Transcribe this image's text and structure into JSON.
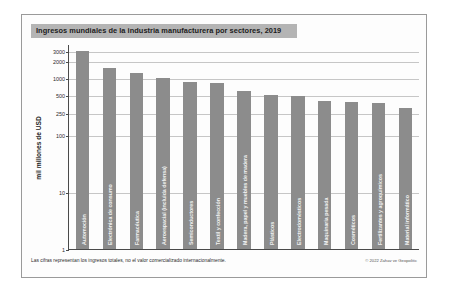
{
  "chart_data": {
    "type": "bar",
    "title": "Ingresos mundiales de la industria manufacturera por sectores, 2019",
    "xlabel": "",
    "ylabel": "mil millones de USD",
    "yscale": "log",
    "ylim": [
      1,
      4000
    ],
    "ytick_labels": [
      "3000",
      "2000",
      "1000",
      "500",
      "250",
      "100",
      "10",
      "1"
    ],
    "ytick_values": [
      3000,
      2000,
      1000,
      500,
      250,
      100,
      10,
      1
    ],
    "grid": true,
    "legend": "none",
    "categories": [
      "Automoción",
      "Electrónica de consumo",
      "Farmacéutica",
      "Aeroespacial (incluida defensa)",
      "Semiconductores",
      "Textil y confección",
      "Madera, papel y muebles de madera",
      "Plásticos",
      "Electrodomésticos",
      "Maquinaria pesada",
      "Cosméticos",
      "Fertilizantes y agroquímicos",
      "Material informático"
    ],
    "values": [
      3000,
      1500,
      1250,
      1000,
      850,
      820,
      600,
      500,
      490,
      400,
      380,
      370,
      300
    ],
    "footnote": "Las cifras representan los ingresos totales, no el valor comercializado internacionalmente.",
    "copyright": "© 2022 Zahav ve Geopolitic"
  }
}
